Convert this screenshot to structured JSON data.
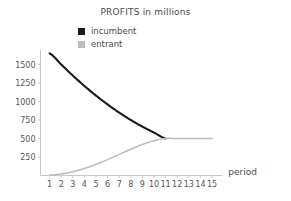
{
  "chart_data": {
    "type": "line",
    "title": "PROFITS in millions",
    "xlabel": "period",
    "ylabel": "",
    "grid": false,
    "legend_position": "top-center",
    "x": [
      1,
      2,
      3,
      4,
      5,
      6,
      7,
      8,
      9,
      10,
      11,
      12,
      13,
      14,
      15
    ],
    "xtick_labels": [
      "1",
      "2",
      "3",
      "4",
      "5",
      "6",
      "7",
      "8",
      "9",
      "10",
      "11",
      "12",
      "13",
      "14",
      "15"
    ],
    "xlim": [
      0.5,
      15.5
    ],
    "ytick_labels": [
      "250",
      "500",
      "750",
      "1000",
      "1250",
      "1500"
    ],
    "yticks": [
      250,
      500,
      750,
      1000,
      1250,
      1500
    ],
    "ylim": [
      0,
      1700
    ],
    "series": [
      {
        "name": "incumbent",
        "color": "#1a1a1a",
        "values": [
          1650,
          1500,
          1350,
          1210,
          1080,
          960,
          850,
          750,
          660,
          580,
          500,
          null,
          null,
          null,
          null
        ]
      },
      {
        "name": "entrant",
        "color": "#bcbcbc",
        "values": [
          5,
          20,
          50,
          95,
          150,
          215,
          285,
          355,
          420,
          470,
          500,
          500,
          500,
          500,
          500
        ]
      }
    ]
  },
  "legend": {
    "items": [
      {
        "label": "incumbent",
        "swatch_color": "#1a1a1a",
        "swatch_name": "legend-swatch-incumbent"
      },
      {
        "label": "entrant",
        "swatch_color": "#bcbcbc",
        "swatch_name": "legend-swatch-entrant"
      }
    ]
  },
  "colors": {
    "incumbent": "#1a1a1a",
    "entrant": "#bcbcbc",
    "axis": "#c8c8c8",
    "text": "#4a4a4a"
  }
}
